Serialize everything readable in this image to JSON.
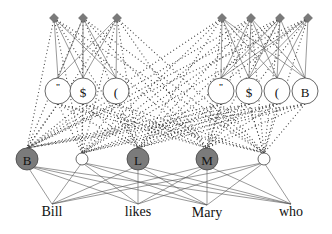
{
  "diagram": {
    "type": "neural-network-architecture",
    "left_group": {
      "diamonds": [
        {
          "x": 54,
          "y": 18
        },
        {
          "x": 83,
          "y": 18
        },
        {
          "x": 117,
          "y": 18
        }
      ],
      "feature_nodes": [
        {
          "label": "\"",
          "x": 58,
          "y": 91
        },
        {
          "label": "$",
          "x": 83,
          "y": 91
        },
        {
          "label": "(",
          "x": 116,
          "y": 91
        }
      ]
    },
    "right_group": {
      "diamonds": [
        {
          "x": 222,
          "y": 18
        },
        {
          "x": 251,
          "y": 18
        },
        {
          "x": 280,
          "y": 18
        },
        {
          "x": 308,
          "y": 18
        }
      ],
      "feature_nodes": [
        {
          "label": "\"",
          "x": 221,
          "y": 91
        },
        {
          "label": "$",
          "x": 249,
          "y": 91
        },
        {
          "label": "(",
          "x": 277,
          "y": 91
        },
        {
          "label": "B",
          "x": 305,
          "y": 91
        }
      ]
    },
    "tag_nodes": [
      {
        "label": "B",
        "x": 27,
        "y": 159,
        "r": 11,
        "filled": true
      },
      {
        "label": "",
        "x": 82,
        "y": 159,
        "r": 6,
        "filled": false
      },
      {
        "label": "L",
        "x": 138,
        "y": 159,
        "r": 11,
        "filled": true
      },
      {
        "label": "M",
        "x": 207,
        "y": 159,
        "r": 11,
        "filled": true
      },
      {
        "label": "",
        "x": 264,
        "y": 159,
        "r": 6,
        "filled": false
      }
    ],
    "words": [
      {
        "text": "Bill",
        "x": 52,
        "y": 216
      },
      {
        "text": "likes",
        "x": 138,
        "y": 216
      },
      {
        "text": "Mary",
        "x": 207,
        "y": 217
      },
      {
        "text": "who",
        "x": 291,
        "y": 216
      }
    ],
    "colors": {
      "filled_node": "#7b7b7b",
      "diamond": "#7a7a7a",
      "line": "#555555"
    }
  }
}
